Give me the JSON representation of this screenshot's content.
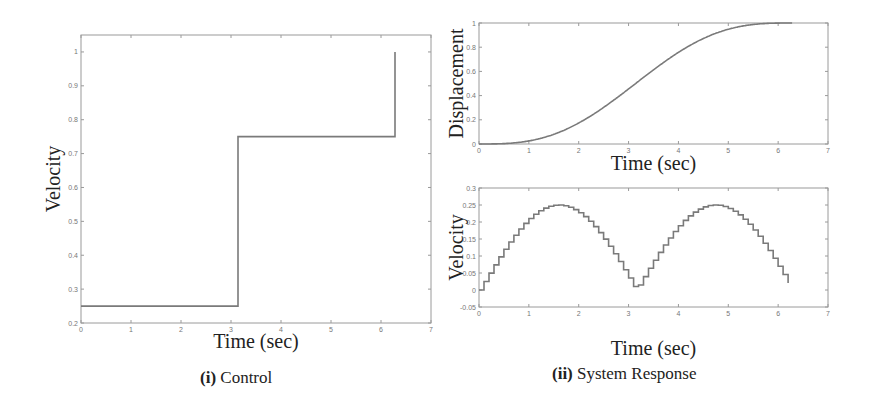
{
  "figure": {
    "captions": [
      {
        "prefix": "(i)",
        "text": "Control"
      },
      {
        "prefix": "(ii)",
        "text": "System Response"
      }
    ],
    "colors": {
      "line": "#7a7a7a",
      "axes": "#9a9a9a",
      "tick_text": "#777777",
      "label_text": "#222222"
    }
  },
  "chart_data": [
    {
      "id": "control",
      "type": "line",
      "title": "",
      "xlabel": "Time (sec)",
      "ylabel": "Velocity",
      "xlim": [
        0,
        7
      ],
      "ylim": [
        0.2,
        1.05
      ],
      "xticks": [
        0,
        1,
        2,
        3,
        4,
        5,
        6,
        7
      ],
      "yticks": [
        0.2,
        0.3,
        0.4,
        0.5,
        0.6,
        0.7,
        0.8,
        0.9,
        1
      ],
      "ytick_labels": [
        "0.2",
        "0.3",
        "0.4",
        "0.5",
        "0.6",
        "0.7",
        "0.8",
        "0.9",
        "1"
      ],
      "grid": false,
      "series": [
        {
          "name": "control velocity",
          "step": true,
          "x": [
            0,
            3.14,
            3.14,
            6.28,
            6.28
          ],
          "y": [
            0.25,
            0.25,
            0.75,
            0.75,
            1.0
          ]
        }
      ],
      "box": {
        "left": 81,
        "top": 35,
        "right": 431,
        "bottom": 323
      }
    },
    {
      "id": "displacement",
      "type": "line",
      "title": "",
      "xlabel": "Time (sec)",
      "ylabel": "Displacement",
      "xlim": [
        0,
        7
      ],
      "ylim": [
        0,
        1
      ],
      "xticks": [
        0,
        1,
        2,
        3,
        4,
        5,
        6,
        7
      ],
      "yticks": [
        0,
        0.2,
        0.4,
        0.6,
        0.8,
        1
      ],
      "ytick_labels": [
        "0",
        "0.2",
        "0.4",
        "0.6",
        "0.8",
        "1"
      ],
      "grid": false,
      "series": [
        {
          "name": "displacement",
          "x": [
            0,
            0.5,
            1,
            1.5,
            2,
            2.5,
            3,
            3.14,
            3.5,
            4,
            4.5,
            5,
            5.5,
            6,
            6.28
          ],
          "y": [
            0,
            0.003,
            0.025,
            0.08,
            0.17,
            0.3,
            0.45,
            0.5,
            0.56,
            0.64,
            0.72,
            0.8,
            0.88,
            0.95,
            1.0
          ]
        }
      ],
      "box": {
        "left": 479,
        "top": 23,
        "right": 828,
        "bottom": 144
      }
    },
    {
      "id": "velocity-response",
      "type": "line",
      "title": "",
      "xlabel": "Time (sec)",
      "ylabel": "Velocity",
      "xlim": [
        0,
        7
      ],
      "ylim": [
        -0.05,
        0.3
      ],
      "xticks": [
        0,
        1,
        2,
        3,
        4,
        5,
        6,
        7
      ],
      "yticks": [
        -0.05,
        0,
        0.05,
        0.1,
        0.15,
        0.2,
        0.25,
        0.3
      ],
      "ytick_labels": [
        "-0.05",
        "0",
        "0.05",
        "0.1",
        "0.15",
        "0.2",
        "0.25",
        "0.3"
      ],
      "grid": false,
      "series": [
        {
          "name": "velocity (staircase)",
          "step": true,
          "x": [
            0,
            0.5,
            1,
            1.57,
            2,
            2.5,
            3,
            3.2,
            3.5,
            4,
            4.71,
            5,
            5.5,
            6,
            6.28
          ],
          "y": [
            0,
            0.12,
            0.21,
            0.25,
            0.227,
            0.15,
            0.035,
            0.0,
            0.088,
            0.19,
            0.25,
            0.24,
            0.18,
            0.07,
            0.01
          ]
        }
      ],
      "box": {
        "left": 479,
        "top": 188,
        "right": 828,
        "bottom": 307
      }
    }
  ]
}
